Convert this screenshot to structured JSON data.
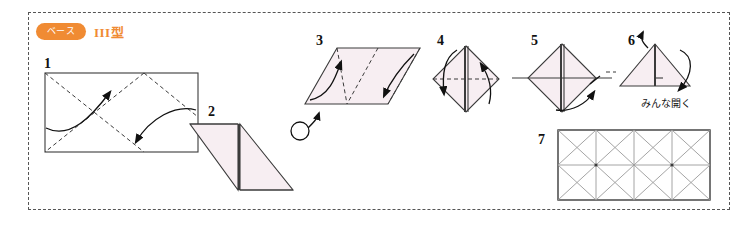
{
  "document": {
    "type": "origami-instruction-diagram",
    "header": {
      "badge_label": "ベース",
      "base_title": "III型"
    },
    "colors": {
      "badge_background": "#f08b33",
      "title_text": "#f08b33",
      "paper_fill": "#f7eef2",
      "paper_stroke": "#3b3b3b",
      "crease_light": "#9a9a9a",
      "frame_border": "#555555",
      "page_background": "#ffffff"
    },
    "steps": [
      {
        "number": "1",
        "shape": "rectangle",
        "description": "Rectangle with two dashed diagonal crease lines and two curved valley-fold arrows"
      },
      {
        "number": "2",
        "shape": "double-triangle",
        "description": "Two pink triangles forming a zigzag after diagonal folds"
      },
      {
        "number": "3",
        "shape": "parallelogram",
        "description": "Parallelogram with dashed diagonal creases and two curved arrows"
      },
      {
        "number": "4",
        "shape": "diamond",
        "description": "Diamond with vertical spine, horizontal dashed crease and two curved arrows"
      },
      {
        "number": "5",
        "shape": "diamond-cross",
        "description": "Diamond with cross creases and curved arrow at lower right"
      },
      {
        "number": "6",
        "shape": "triangle",
        "description": "Triangle with up and down arrows",
        "caption": "みんな開く"
      },
      {
        "number": "7",
        "shape": "crease-pattern",
        "description": "Final unfolded rectangle crease pattern, 4 columns by 2 rows with X diagonals"
      }
    ],
    "symbols": {
      "turn_over_label": "turn-over-symbol"
    }
  }
}
